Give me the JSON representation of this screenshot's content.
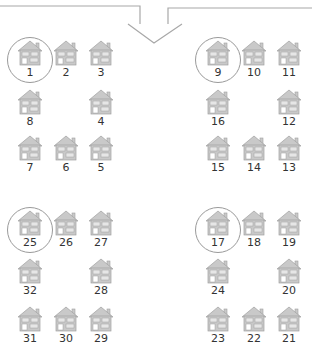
{
  "diagram": {
    "colors": {
      "line": "#a8a8a8",
      "house_fill": "#c9c9c9",
      "house_stroke": "#a0a0a0",
      "window": "#e6e6e6",
      "door": "#ffffff",
      "circle": "#9a9a9a",
      "label": "#333333"
    },
    "arrow": {
      "description": "Two lines converging into a downward arrow",
      "left_line": [
        [
          0,
          6
        ],
        [
          140,
          6
        ],
        [
          140,
          24
        ]
      ],
      "right_line": [
        [
          312,
          8
        ],
        [
          168,
          8
        ],
        [
          168,
          24
        ]
      ],
      "head": [
        [
          128,
          24
        ],
        [
          154,
          43
        ],
        [
          182,
          24
        ]
      ]
    },
    "groups": [
      {
        "name": "group-top-left",
        "houses": [
          {
            "n": "1",
            "x": 30,
            "y": 54,
            "circled": true
          },
          {
            "n": "2",
            "x": 66,
            "y": 54
          },
          {
            "n": "3",
            "x": 101,
            "y": 54
          },
          {
            "n": "4",
            "x": 101,
            "y": 103
          },
          {
            "n": "5",
            "x": 101,
            "y": 149
          },
          {
            "n": "6",
            "x": 66,
            "y": 149
          },
          {
            "n": "7",
            "x": 30,
            "y": 149
          },
          {
            "n": "8",
            "x": 30,
            "y": 103
          }
        ]
      },
      {
        "name": "group-top-right",
        "houses": [
          {
            "n": "9",
            "x": 218,
            "y": 54,
            "circled": true
          },
          {
            "n": "10",
            "x": 254,
            "y": 54
          },
          {
            "n": "11",
            "x": 289,
            "y": 54
          },
          {
            "n": "12",
            "x": 289,
            "y": 103
          },
          {
            "n": "13",
            "x": 289,
            "y": 149
          },
          {
            "n": "14",
            "x": 254,
            "y": 149
          },
          {
            "n": "15",
            "x": 218,
            "y": 149
          },
          {
            "n": "16",
            "x": 218,
            "y": 103
          }
        ]
      },
      {
        "name": "group-bottom-right",
        "houses": [
          {
            "n": "17",
            "x": 218,
            "y": 224,
            "circled": true
          },
          {
            "n": "18",
            "x": 254,
            "y": 224
          },
          {
            "n": "19",
            "x": 289,
            "y": 224
          },
          {
            "n": "20",
            "x": 289,
            "y": 272
          },
          {
            "n": "21",
            "x": 289,
            "y": 320
          },
          {
            "n": "22",
            "x": 254,
            "y": 320
          },
          {
            "n": "23",
            "x": 218,
            "y": 320
          },
          {
            "n": "24",
            "x": 218,
            "y": 272
          }
        ]
      },
      {
        "name": "group-bottom-left",
        "houses": [
          {
            "n": "25",
            "x": 30,
            "y": 224,
            "circled": true
          },
          {
            "n": "26",
            "x": 66,
            "y": 224
          },
          {
            "n": "27",
            "x": 101,
            "y": 224
          },
          {
            "n": "28",
            "x": 101,
            "y": 272
          },
          {
            "n": "29",
            "x": 101,
            "y": 320
          },
          {
            "n": "30",
            "x": 66,
            "y": 320
          },
          {
            "n": "31",
            "x": 30,
            "y": 320
          },
          {
            "n": "32",
            "x": 30,
            "y": 272
          }
        ]
      }
    ]
  }
}
